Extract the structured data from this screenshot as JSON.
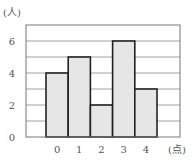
{
  "chart_data": {
    "type": "bar",
    "title": "",
    "xlabel": "(点)",
    "ylabel": "(人)",
    "categories": [
      "0",
      "1",
      "2",
      "3",
      "4"
    ],
    "values": [
      4,
      5,
      2,
      6,
      3
    ],
    "yticks": [
      "0",
      "2",
      "4",
      "6"
    ],
    "ylim": [
      0,
      6.75
    ],
    "grid": true,
    "grid_step": 1,
    "bar_fill": "#e6e6e6",
    "bar_stroke": "#222222",
    "grid_color": "#8a8a8a"
  }
}
